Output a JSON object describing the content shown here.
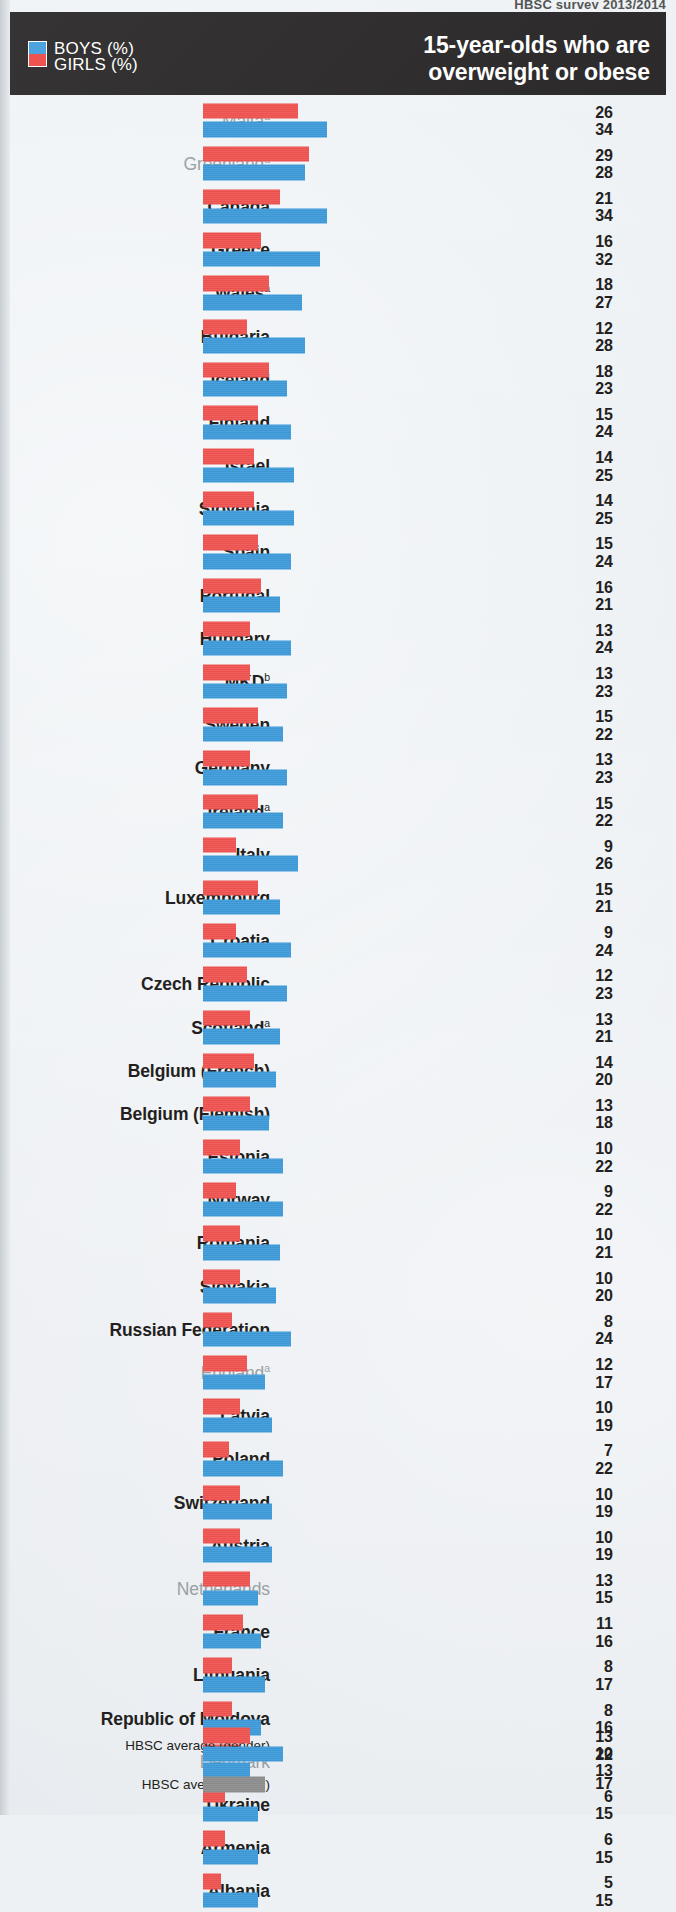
{
  "running_head": "HBSC survey 2013/2014",
  "header": {
    "title_line1": "15-year-olds who are",
    "title_line2": "overweight or obese",
    "legend": [
      {
        "key": "boys",
        "label": "BOYS (%)",
        "color": "#3d9ad8"
      },
      {
        "key": "girls",
        "label": "GIRLS (%)",
        "color": "#ef5350"
      }
    ]
  },
  "chart_data": {
    "type": "bar",
    "orientation": "horizontal",
    "title": "15-year-olds who are overweight or obese",
    "subtitle": "HBSC survey 2013/2014",
    "xlabel": "",
    "ylabel": "",
    "unit": "%",
    "xlim": [
      0,
      34
    ],
    "grid": false,
    "legend_position": "top-left",
    "series": [
      {
        "name": "GIRLS (%)",
        "color": "#ef5350",
        "values": [
          26,
          29,
          21,
          16,
          18,
          12,
          18,
          15,
          14,
          14,
          15,
          16,
          13,
          13,
          15,
          13,
          15,
          9,
          15,
          9,
          12,
          13,
          14,
          13,
          10,
          9,
          10,
          10,
          8,
          12,
          10,
          7,
          10,
          10,
          13,
          11,
          8,
          8,
          10,
          6,
          6,
          5
        ]
      },
      {
        "name": "BOYS (%)",
        "color": "#3d9ad8",
        "values": [
          34,
          28,
          34,
          32,
          27,
          28,
          23,
          24,
          25,
          25,
          24,
          21,
          24,
          23,
          22,
          23,
          22,
          26,
          21,
          24,
          23,
          21,
          20,
          18,
          22,
          22,
          21,
          20,
          24,
          17,
          19,
          22,
          19,
          19,
          15,
          16,
          17,
          16,
          13,
          15,
          15,
          15
        ]
      }
    ],
    "categories": [
      "Malta",
      "Greenland",
      "Canada",
      "Greece",
      "Wales",
      "Bulgaria",
      "Iceland",
      "Finland",
      "Israel",
      "Slovenia",
      "Spain",
      "Portugal",
      "Hungary",
      "MKD",
      "Sweden",
      "Germany",
      "Ireland",
      "Italy",
      "Luxembourg",
      "Croatia",
      "Czech Republic",
      "Scotland",
      "Belgium (French)",
      "Belgium (Flemish)",
      "Estonia",
      "Norway",
      "Romania",
      "Slovakia",
      "Russian Federation",
      "England",
      "Latvia",
      "Poland",
      "Switzerland",
      "Austria",
      "Netherlands",
      "France",
      "Lithuania",
      "Republic of Moldova",
      "Denmark",
      "Ukraine",
      "Armenia",
      "Albania"
    ],
    "averages": [
      {
        "label": "HBSC average (gender)",
        "girls": 13,
        "boys": 22
      },
      {
        "label": "HBSC average (total)",
        "total": 17,
        "color": "#8d8d8d"
      }
    ]
  },
  "rows": [
    {
      "name": "Malta",
      "sup": "a",
      "girls": 26,
      "boys": 34,
      "dim": true
    },
    {
      "name": "Greenland",
      "sup": "a",
      "girls": 29,
      "boys": 28,
      "dim": true
    },
    {
      "name": "Canada",
      "sup": "",
      "girls": 21,
      "boys": 34,
      "dim": false
    },
    {
      "name": "Greece",
      "sup": "",
      "girls": 16,
      "boys": 32,
      "dim": false
    },
    {
      "name": "Wales",
      "sup": "a",
      "girls": 18,
      "boys": 27,
      "dim": false
    },
    {
      "name": "Bulgaria",
      "sup": "",
      "girls": 12,
      "boys": 28,
      "dim": false
    },
    {
      "name": "Iceland",
      "sup": "",
      "girls": 18,
      "boys": 23,
      "dim": false
    },
    {
      "name": "Finland",
      "sup": "",
      "girls": 15,
      "boys": 24,
      "dim": false
    },
    {
      "name": "Israel",
      "sup": "",
      "girls": 14,
      "boys": 25,
      "dim": false
    },
    {
      "name": "Slovenia",
      "sup": "",
      "girls": 14,
      "boys": 25,
      "dim": false
    },
    {
      "name": "Spain",
      "sup": "",
      "girls": 15,
      "boys": 24,
      "dim": false
    },
    {
      "name": "Portugal",
      "sup": "",
      "girls": 16,
      "boys": 21,
      "dim": false
    },
    {
      "name": "Hungary",
      "sup": "",
      "girls": 13,
      "boys": 24,
      "dim": false
    },
    {
      "name": "MKD",
      "sup": "b",
      "girls": 13,
      "boys": 23,
      "dim": false
    },
    {
      "name": "Sweden",
      "sup": "",
      "girls": 15,
      "boys": 22,
      "dim": false
    },
    {
      "name": "Germany",
      "sup": "",
      "girls": 13,
      "boys": 23,
      "dim": false
    },
    {
      "name": "Ireland",
      "sup": "a",
      "girls": 15,
      "boys": 22,
      "dim": false
    },
    {
      "name": "Italy",
      "sup": "",
      "girls": 9,
      "boys": 26,
      "dim": false
    },
    {
      "name": "Luxembourg",
      "sup": "",
      "girls": 15,
      "boys": 21,
      "dim": false
    },
    {
      "name": "Croatia",
      "sup": "",
      "girls": 9,
      "boys": 24,
      "dim": false
    },
    {
      "name": "Czech Republic",
      "sup": "",
      "girls": 12,
      "boys": 23,
      "dim": false
    },
    {
      "name": "Scotland",
      "sup": "a",
      "girls": 13,
      "boys": 21,
      "dim": false
    },
    {
      "name": "Belgium (French)",
      "sup": "",
      "girls": 14,
      "boys": 20,
      "dim": false
    },
    {
      "name": "Belgium (Flemish)",
      "sup": "",
      "girls": 13,
      "boys": 18,
      "dim": false
    },
    {
      "name": "Estonia",
      "sup": "",
      "girls": 10,
      "boys": 22,
      "dim": false
    },
    {
      "name": "Norway",
      "sup": "",
      "girls": 9,
      "boys": 22,
      "dim": false
    },
    {
      "name": "Romania",
      "sup": "",
      "girls": 10,
      "boys": 21,
      "dim": false
    },
    {
      "name": "Slovakia",
      "sup": "",
      "girls": 10,
      "boys": 20,
      "dim": false
    },
    {
      "name": "Russian Federation",
      "sup": "",
      "girls": 8,
      "boys": 24,
      "dim": false
    },
    {
      "name": "England",
      "sup": "a",
      "girls": 12,
      "boys": 17,
      "dim": true
    },
    {
      "name": "Latvia",
      "sup": "",
      "girls": 10,
      "boys": 19,
      "dim": false
    },
    {
      "name": "Poland",
      "sup": "",
      "girls": 7,
      "boys": 22,
      "dim": false
    },
    {
      "name": "Switzerland",
      "sup": "",
      "girls": 10,
      "boys": 19,
      "dim": false
    },
    {
      "name": "Austria",
      "sup": "",
      "girls": 10,
      "boys": 19,
      "dim": false
    },
    {
      "name": "Netherlands",
      "sup": "",
      "girls": 13,
      "boys": 15,
      "dim": true
    },
    {
      "name": "France",
      "sup": "",
      "girls": 11,
      "boys": 16,
      "dim": false
    },
    {
      "name": "Lithuania",
      "sup": "",
      "girls": 8,
      "boys": 17,
      "dim": false
    },
    {
      "name": "Republic of Moldova",
      "sup": "",
      "girls": 8,
      "boys": 16,
      "dim": false
    },
    {
      "name": "Denmark",
      "sup": "",
      "girls": 10,
      "boys": 13,
      "dim": true
    },
    {
      "name": "Ukraine",
      "sup": "",
      "girls": 6,
      "boys": 15,
      "dim": false
    },
    {
      "name": "Armenia",
      "sup": "",
      "girls": 6,
      "boys": 15,
      "dim": false
    },
    {
      "name": "Albania",
      "sup": "",
      "girls": 5,
      "boys": 15,
      "dim": false
    }
  ],
  "averages": [
    {
      "name": "HBSC average (gender)",
      "girls": 13,
      "boys": 22,
      "total": null
    },
    {
      "name": "HBSC average (total)",
      "girls": null,
      "boys": null,
      "total": 17
    }
  ]
}
